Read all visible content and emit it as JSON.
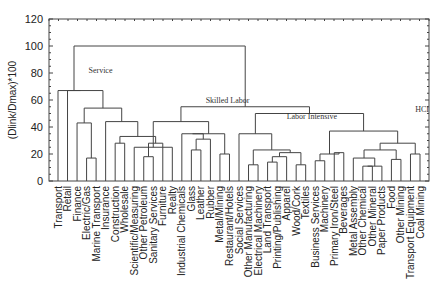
{
  "chart_data": {
    "type": "dendrogram",
    "title": "",
    "xlabel": "",
    "ylabel": "(Dlink/Dmax)*100",
    "ylim": [
      0,
      120
    ],
    "yticks": [
      0,
      20,
      40,
      60,
      80,
      100,
      120
    ],
    "leaves": [
      "Transport",
      "Retail",
      "Finance",
      "Electric/Gas",
      "Marine Transport",
      "Insurance",
      "Construction",
      "Wholesale",
      "Scientific/Measuring",
      "Other Petroleum",
      "Sanitary Services",
      "Furniture",
      "Realty",
      "Industrial Chemicals",
      "Glass",
      "Leather",
      "Rubber",
      "Metal/Mining",
      "Restaurant/Hotels",
      "Social Services",
      "Other Manufacturing",
      "Electrical Machinery",
      "Land Transport",
      "Printing/Publishing",
      "Apparel",
      "Wood/Cork",
      "Textiles",
      "Business Services",
      "Machinery",
      "Primary Iron/Steel",
      "Beverages",
      "Metal Assembly",
      "Other Chemical",
      "Other Mineral",
      "Paper Products",
      "Food",
      "Other Mining",
      "Transport Equipment",
      "Coal Mining"
    ],
    "merges": [
      {
        "id": "a",
        "left": "Electric/Gas",
        "right": "Marine Transport",
        "height": 17
      },
      {
        "id": "b",
        "left": "Finance",
        "right": "a",
        "height": 43
      },
      {
        "id": "c",
        "left": "Construction",
        "right": "Wholesale",
        "height": 28
      },
      {
        "id": "d",
        "left": "Other Petroleum",
        "right": "Sanitary Services",
        "height": 18
      },
      {
        "id": "e",
        "left": "d",
        "right": "Furniture",
        "height": 28
      },
      {
        "id": "f",
        "left": "c",
        "right": "e",
        "height": 33
      },
      {
        "id": "g",
        "left": "Insurance",
        "right": "f",
        "height": 44
      },
      {
        "id": "h",
        "left": "b",
        "right": "g",
        "height": 54
      },
      {
        "id": "i",
        "left": "Transport",
        "right": "h",
        "height": 67
      },
      {
        "id": "j",
        "left": "Retail",
        "right": "i",
        "height": 67
      },
      {
        "id": "k",
        "left": "Scientific/Measuring",
        "right": "Realty",
        "height": 25
      },
      {
        "id": "l",
        "left": "Glass",
        "right": "Leather",
        "height": 23
      },
      {
        "id": "m",
        "left": "l",
        "right": "Rubber",
        "height": 31
      },
      {
        "id": "n",
        "left": "Industrial Chemicals",
        "right": "m",
        "height": 35
      },
      {
        "id": "o",
        "left": "Metal/Mining",
        "right": "Restaurant/Hotels",
        "height": 20
      },
      {
        "id": "p",
        "left": "n",
        "right": "o",
        "height": 35
      },
      {
        "id": "q",
        "left": "k",
        "right": "p",
        "height": 44
      },
      {
        "id": "r",
        "left": "Other Manufacturing",
        "right": "Electrical Machinery",
        "height": 12
      },
      {
        "id": "s",
        "left": "Land Transport",
        "right": "Printing/Publishing",
        "height": 14
      },
      {
        "id": "t",
        "left": "s",
        "right": "Apparel",
        "height": 18
      },
      {
        "id": "u",
        "left": "Wood/Cork",
        "right": "Textiles",
        "height": 12
      },
      {
        "id": "v",
        "left": "t",
        "right": "u",
        "height": 21
      },
      {
        "id": "w",
        "left": "r",
        "right": "v",
        "height": 23
      },
      {
        "id": "x",
        "left": "Social Services",
        "right": "w",
        "height": 35
      },
      {
        "id": "y",
        "left": "Business Services",
        "right": "Machinery",
        "height": 15
      },
      {
        "id": "z",
        "left": "Primary Iron/Steel",
        "right": "Beverages",
        "height": 21
      },
      {
        "id": "aa",
        "left": "y",
        "right": "z",
        "height": 20
      },
      {
        "id": "ab",
        "left": "Other Chemical",
        "right": "Other Mineral",
        "height": 11
      },
      {
        "id": "ac",
        "left": "ab",
        "right": "Paper Products",
        "height": 11
      },
      {
        "id": "ad",
        "left": "Metal Assembly",
        "right": "ac",
        "height": 17
      },
      {
        "id": "ae",
        "left": "Food",
        "right": "Other Mining",
        "height": 16
      },
      {
        "id": "af",
        "left": "ad",
        "right": "ae",
        "height": 23
      },
      {
        "id": "ag",
        "left": "Transport Equipment",
        "right": "Coal Mining",
        "height": 20
      },
      {
        "id": "ah",
        "left": "af",
        "right": "ag",
        "height": 28
      },
      {
        "id": "ai",
        "left": "aa",
        "right": "ah",
        "height": 37
      },
      {
        "id": "aj",
        "left": "x",
        "right": "ai",
        "height": 50
      },
      {
        "id": "ak",
        "left": "q",
        "right": "aj",
        "height": 55
      },
      {
        "id": "al",
        "left": "j",
        "right": "ak",
        "height": 100
      }
    ],
    "annotations": [
      {
        "text": "Service",
        "x_leaf": 3.2,
        "y": 80
      },
      {
        "text": "Skilled Labor",
        "x_leaf": 15.5,
        "y": 58
      },
      {
        "text": "Labor Intensive",
        "x_leaf": 24,
        "y": 46
      },
      {
        "text": "HCI",
        "x_leaf": 37.5,
        "y": 51
      }
    ]
  }
}
